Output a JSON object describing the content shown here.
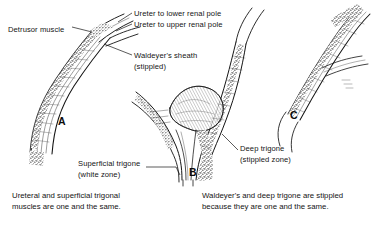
{
  "figure": {
    "background_color": "#ffffff",
    "ink_color": "#141414",
    "panels": [
      {
        "letter": "A",
        "x": 58,
        "y": 115,
        "description": "Intramural ureter with detrusor muscle and duplicated ureter entering bladder wall"
      },
      {
        "letter": "B",
        "x": 189,
        "y": 166,
        "description": "Sagittal section of bladder base showing superficial trigone and deep trigone"
      },
      {
        "letter": "C",
        "x": 290,
        "y": 109,
        "description": "Detail of ureteral orifice with Waldeyer's sheath continuing as deep trigone"
      }
    ],
    "labels": [
      {
        "id": "detrusor-muscle",
        "lines": [
          "Detrusor muscle"
        ],
        "x": 8,
        "y": 24
      },
      {
        "id": "ureter-lower-pole",
        "lines": [
          "Ureter to lower renal pole"
        ],
        "x": 134,
        "y": 8
      },
      {
        "id": "ureter-upper-pole",
        "lines": [
          "Ureter to upper renal pole"
        ],
        "x": 134,
        "y": 19
      },
      {
        "id": "waldeyers-sheath",
        "lines": [
          "Waldeyer's sheath",
          "(stippled)"
        ],
        "x": 134,
        "y": 50
      },
      {
        "id": "deep-trigone",
        "lines": [
          "Deep trigone",
          "(stippled zone)"
        ],
        "x": 240,
        "y": 143
      },
      {
        "id": "superficial-trigone",
        "lines": [
          "Superficial trigone",
          "(white zone)"
        ],
        "x": 78,
        "y": 158
      }
    ],
    "captions": [
      {
        "id": "caption-left",
        "lines": [
          "Ureteral and superficial trigonal",
          "muscles are one and the same."
        ],
        "x": 12,
        "y": 190
      },
      {
        "id": "caption-right",
        "lines": [
          "Waldeyer's and deep trigone are stippled",
          "because they are one and the same."
        ],
        "x": 202,
        "y": 190
      }
    ]
  }
}
